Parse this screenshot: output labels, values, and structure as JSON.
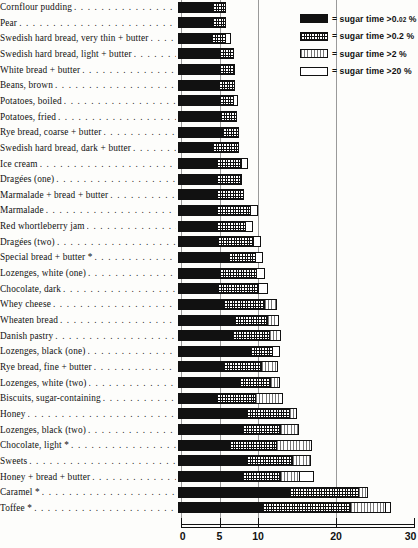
{
  "legend": {
    "title": "",
    "items": [
      {
        "pattern": "solid-black",
        "label": "= sugar time >0.02 %",
        "label_main": "= sugar time >0.",
        "label_small": "02",
        "label_tail": " %"
      },
      {
        "pattern": "cross-hatch",
        "label": "= sugar time >0.2 %",
        "label_main": "= sugar time >0.2 %",
        "label_small": "",
        "label_tail": ""
      },
      {
        "pattern": "vertical-rule",
        "label": "= sugar time >2 %",
        "label_main": "= sugar time >2 %",
        "label_small": "",
        "label_tail": ""
      },
      {
        "pattern": "white",
        "label": "= sugar time >20 %",
        "label_main": "= sugar time >20 %",
        "label_small": "",
        "label_tail": ""
      }
    ]
  },
  "axis": {
    "ticks": [
      "0",
      "5",
      "10",
      "20",
      "30"
    ],
    "tick_values": [
      0,
      5,
      10,
      20,
      30
    ],
    "min": 0,
    "max": 30
  },
  "leader_dots": ". . . . . . . . . . . . . . . . . . . . . . . . . . . . . . . . . . . .",
  "chart_data": {
    "type": "bar",
    "title": "",
    "subtitle": "",
    "xlabel": "",
    "ylabel": "",
    "orientation": "horizontal",
    "stacked": true,
    "grid": true,
    "legend_position": "top-right",
    "xlim": [
      0,
      30
    ],
    "xticks": [
      0,
      5,
      10,
      20,
      30
    ],
    "series": [
      {
        "name": "sugar time >0.02 %",
        "pattern": "solid-black"
      },
      {
        "name": "sugar time >0.2 %",
        "pattern": "cross-hatch"
      },
      {
        "name": "sugar time >2 %",
        "pattern": "vertical-rule"
      },
      {
        "name": "sugar time >20 %",
        "pattern": "white"
      }
    ],
    "categories": [
      "Cornflour pudding",
      "Pear",
      "Swedish hard bread, very thin + butter",
      "Swedish hard bread, light + butter",
      "White bread + butter",
      "Beans, brown",
      "Potatoes, boiled",
      "Potatoes, fried",
      "Rye bread, coarse + butter",
      "Swedish hard bread, dark + butter",
      "Ice cream",
      "Dragées (one)",
      "Marmalade + bread + butter",
      "Marmalade",
      "Red whortleberry jam",
      "Dragées (two)",
      "Special bread + butter *",
      "Lozenges, white (one)",
      "Chocolate, dark",
      "Whey cheese",
      "Wheaten bread",
      "Danish pastry",
      "Lozenges, black (one)",
      "Rye bread, fine + butter",
      "Lozenges, white (two)",
      "Biscuits, sugar-containing",
      "Honey",
      "Lozenges, black (two)",
      "Chocolate, light *",
      "Sweets",
      "Honey + bread + butter",
      "Caramel *",
      "Toffee *"
    ],
    "rows": [
      {
        "category": "Cornflour pudding",
        "segments": [
          4.5,
          1.8,
          0,
          0
        ],
        "total": 6.3
      },
      {
        "category": "Pear",
        "segments": [
          4.5,
          1.8,
          0,
          0
        ],
        "total": 6.3
      },
      {
        "category": "Swedish hard bread, very thin + butter",
        "segments": [
          4.4,
          1.9,
          0,
          0.8
        ],
        "total": 7.1
      },
      {
        "category": "Swedish hard bread, light + butter",
        "segments": [
          5.4,
          2.0,
          0,
          0
        ],
        "total": 7.4
      },
      {
        "category": "White bread + butter",
        "segments": [
          5.5,
          2.0,
          0,
          0
        ],
        "total": 7.5
      },
      {
        "category": "Beans, brown",
        "segments": [
          5.3,
          2.2,
          0,
          0
        ],
        "total": 7.5
      },
      {
        "category": "Potatoes, boiled",
        "segments": [
          5.5,
          1.9,
          0,
          0.7
        ],
        "total": 8.1
      },
      {
        "category": "Potatoes, fried",
        "segments": [
          5.6,
          2.2,
          0,
          0
        ],
        "total": 7.8
      },
      {
        "category": "Rye bread, coarse + butter",
        "segments": [
          5.8,
          2.2,
          0,
          0
        ],
        "total": 8.0
      },
      {
        "category": "Swedish hard bread, dark + butter",
        "segments": [
          4.6,
          3.5,
          0,
          0
        ],
        "total": 8.1
      },
      {
        "category": "Ice cream",
        "segments": [
          5.0,
          3.5,
          0,
          0.9
        ],
        "total": 9.4
      },
      {
        "category": "Dragées (one)",
        "segments": [
          5.0,
          3.4,
          0,
          0
        ],
        "total": 8.4
      },
      {
        "category": "Marmalade + bread + butter",
        "segments": [
          5.1,
          3.6,
          0,
          0
        ],
        "total": 8.7
      },
      {
        "category": "Marmalade",
        "segments": [
          5.0,
          4.6,
          0,
          1.0
        ],
        "total": 10.6
      },
      {
        "category": "Red whortleberry jam",
        "segments": [
          5.0,
          4.0,
          0,
          1.0
        ],
        "total": 10.0
      },
      {
        "category": "Dragées (two)",
        "segments": [
          5.2,
          4.8,
          0,
          1.0
        ],
        "total": 11.0
      },
      {
        "category": "Special bread + butter *",
        "segments": [
          6.6,
          3.7,
          0,
          1.0
        ],
        "total": 11.3
      },
      {
        "category": "Lozenges, white (one)",
        "segments": [
          5.4,
          5.0,
          0,
          1.2
        ],
        "total": 11.6
      },
      {
        "category": "Chocolate, dark",
        "segments": [
          5.2,
          5.4,
          0,
          1.3
        ],
        "total": 11.9
      },
      {
        "category": "Whey cheese",
        "segments": [
          6.0,
          5.4,
          1.7,
          0
        ],
        "total": 13.1
      },
      {
        "category": "Wheaten bread",
        "segments": [
          7.4,
          4.4,
          1.6,
          0
        ],
        "total": 13.4
      },
      {
        "category": "Danish pastry",
        "segments": [
          7.2,
          4.8,
          1.6,
          0
        ],
        "total": 13.6
      },
      {
        "category": "Lozenges, black (one)",
        "segments": [
          9.5,
          3.0,
          0,
          1.0
        ],
        "total": 13.5
      },
      {
        "category": "Rye bread, fine + butter",
        "segments": [
          6.0,
          5.0,
          2.2,
          0
        ],
        "total": 13.2
      },
      {
        "category": "Lozenges, white (two)",
        "segments": [
          8.0,
          4.2,
          1.2,
          0
        ],
        "total": 13.4
      },
      {
        "category": "Biscuits, sugar-containing",
        "segments": [
          5.0,
          5.2,
          3.7,
          0
        ],
        "total": 13.9
      },
      {
        "category": "Honey",
        "segments": [
          9.0,
          5.6,
          1.1,
          0
        ],
        "total": 15.7
      },
      {
        "category": "Lozenges, black (two)",
        "segments": [
          8.5,
          5.0,
          2.4,
          0
        ],
        "total": 15.9
      },
      {
        "category": "Chocolate, light *",
        "segments": [
          6.8,
          6.2,
          4.6,
          0
        ],
        "total": 17.6
      },
      {
        "category": "Sweets",
        "segments": [
          9.0,
          6.0,
          2.5,
          0
        ],
        "total": 17.5
      },
      {
        "category": "Honey + bread + butter",
        "segments": [
          8.5,
          5.0,
          2.5,
          1.9
        ],
        "total": 17.9
      },
      {
        "category": "Caramel *",
        "segments": [
          14.5,
          9.0,
          1.2,
          0
        ],
        "total": 24.7
      },
      {
        "category": "Toffee *",
        "segments": [
          11.0,
          11.5,
          4.5,
          0.8
        ],
        "total": 27.8
      }
    ]
  }
}
